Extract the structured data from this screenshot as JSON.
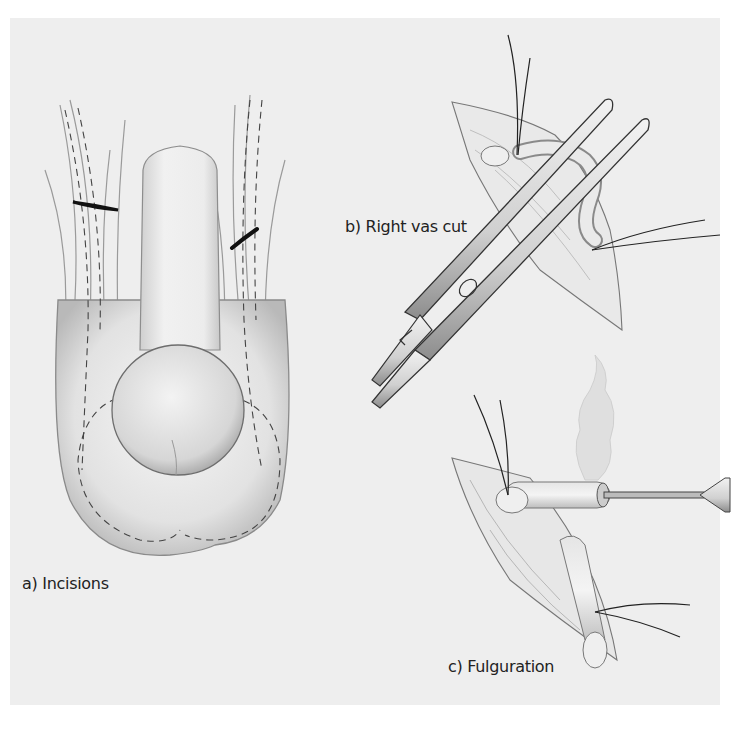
{
  "figure": {
    "panels": [
      {
        "id": "a",
        "caption": "a) Incisions"
      },
      {
        "id": "b",
        "caption": "b) Right vas cut"
      },
      {
        "id": "c",
        "caption": "c) Fulguration"
      }
    ],
    "colors": {
      "background": "#eeeeee",
      "page": "#ffffff",
      "ink": "#2a2a2a"
    }
  }
}
